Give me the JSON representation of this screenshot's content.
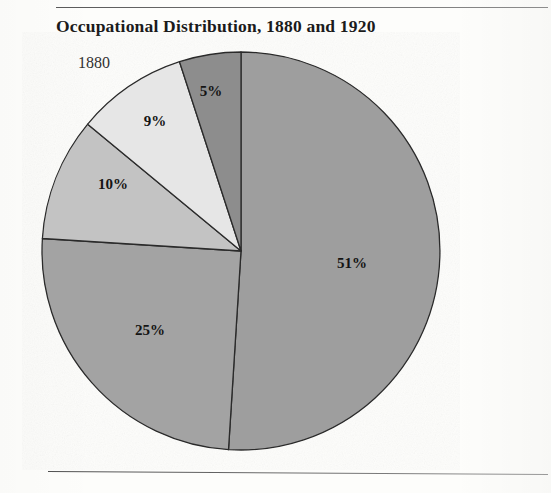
{
  "figure": {
    "title": "Occupational Distribution, 1880 and 1920",
    "series_label": "1880"
  },
  "chart_data": {
    "type": "pie",
    "title": "Occupational Distribution, 1880 and 1920",
    "subtitle": "1880",
    "xlabel": "",
    "ylabel": "",
    "legend": "none",
    "grid": false,
    "start_angle_deg": 0,
    "direction": "clockwise",
    "labels": [
      "51%",
      "25%",
      "10%",
      "9%",
      "5%"
    ],
    "values": [
      51,
      25,
      10,
      9,
      5
    ],
    "total": 100,
    "slices": [
      {
        "label": "51%",
        "value": 51,
        "color": "#9e9e9e",
        "label_x": 352,
        "label_y": 268
      },
      {
        "label": "25%",
        "value": 25,
        "color": "#a3a3a3",
        "label_x": 150,
        "label_y": 335
      },
      {
        "label": "10%",
        "value": 10,
        "color": "#c3c3c3",
        "label_x": 113,
        "label_y": 189
      },
      {
        "label": "9%",
        "value": 9,
        "color": "#e6e6e6",
        "label_x": 155,
        "label_y": 126
      },
      {
        "label": "5%",
        "value": 5,
        "color": "#8d8d8d",
        "label_x": 211,
        "label_y": 96
      }
    ],
    "geometry": {
      "cx": 241,
      "cy": 251,
      "r": 199
    },
    "colors": {
      "slice_51": "#9e9e9e",
      "slice_25": "#a3a3a3",
      "slice_10": "#c3c3c3",
      "slice_9": "#e6e6e6",
      "slice_5": "#8d8d8d",
      "outline": "#2b2b2b",
      "text": "#141414",
      "background": "#fdfdfb"
    }
  }
}
